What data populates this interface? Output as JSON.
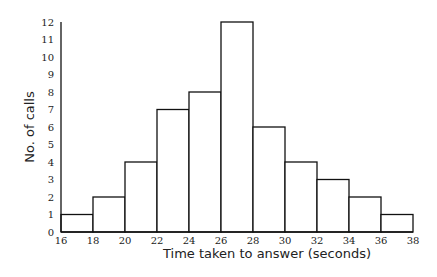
{
  "chart_data": {
    "type": "bar",
    "subtype": "histogram",
    "title": "",
    "xlabel": "Time taken to answer (seconds)",
    "ylabel": "No. of calls",
    "bin_edges": [
      16,
      18,
      20,
      22,
      24,
      26,
      28,
      30,
      32,
      34,
      36,
      38
    ],
    "categories": [
      "16-18",
      "18-20",
      "20-22",
      "22-24",
      "24-26",
      "26-28",
      "28-30",
      "30-32",
      "32-34",
      "34-36",
      "36-38"
    ],
    "values": [
      1,
      2,
      4,
      7,
      8,
      12,
      6,
      4,
      3,
      2,
      1
    ],
    "xlim": [
      16,
      38
    ],
    "ylim": [
      0,
      12
    ],
    "x_ticks": [
      "16",
      "18",
      "20",
      "22",
      "24",
      "26",
      "28",
      "30",
      "32",
      "34",
      "36",
      "38"
    ],
    "y_ticks": [
      "0",
      "1",
      "2",
      "3",
      "4",
      "5",
      "6",
      "7",
      "8",
      "9",
      "10",
      "11",
      "12"
    ],
    "grid": false,
    "legend": null,
    "bar_fill": "#ffffff",
    "bar_stroke": "#111111"
  }
}
